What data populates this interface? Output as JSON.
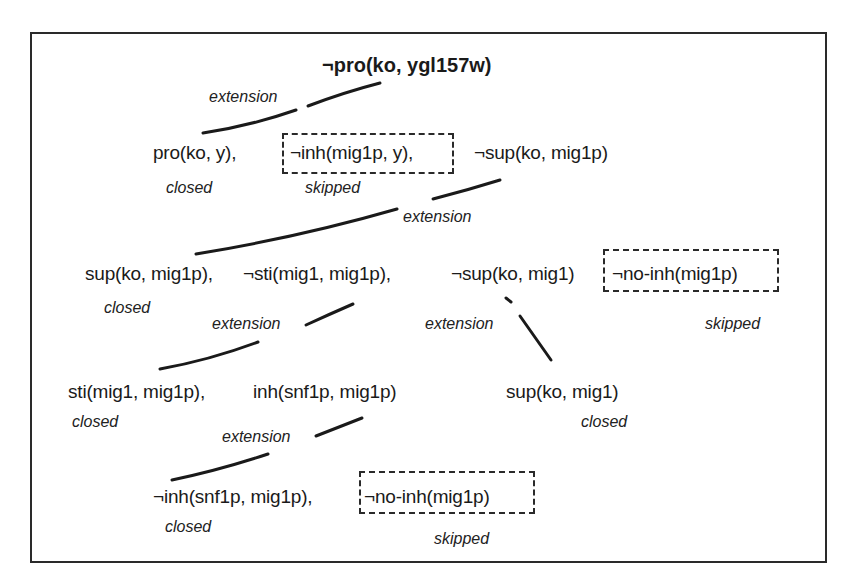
{
  "diagram": {
    "type": "derivation-tree",
    "root": {
      "label": "¬pro(ko, ygl157w)"
    },
    "level1": {
      "edge_label": "extension",
      "literals": [
        {
          "label": "pro(ko, y),",
          "status": "closed"
        },
        {
          "label": "¬inh(mig1p, y),",
          "status": "skipped",
          "boxed": true
        },
        {
          "label": "¬sup(ko, mig1p)",
          "status": ""
        }
      ]
    },
    "level2": {
      "edge_label": "extension",
      "literals": [
        {
          "label": "sup(ko, mig1p),",
          "status": "closed"
        },
        {
          "label": "¬sti(mig1, mig1p),",
          "status": ""
        },
        {
          "label": "¬sup(ko, mig1)",
          "status": ""
        },
        {
          "label": "¬no-inh(mig1p)",
          "status": "skipped",
          "boxed": true
        }
      ]
    },
    "level3_left": {
      "edge_label": "extension",
      "literals": [
        {
          "label": "sti(mig1, mig1p),",
          "status": "closed"
        },
        {
          "label": "inh(snf1p, mig1p)",
          "status": ""
        }
      ]
    },
    "level3_right": {
      "edge_label": "extension",
      "literals": [
        {
          "label": "sup(ko, mig1)",
          "status": "closed"
        }
      ]
    },
    "level4": {
      "edge_label": "extension",
      "literals": [
        {
          "label": "¬inh(snf1p, mig1p),",
          "status": "closed"
        },
        {
          "label": "¬no-inh(mig1p)",
          "status": "skipped",
          "boxed": true
        }
      ]
    }
  },
  "colors": {
    "ink": "#1a1a1a",
    "frame": "#2a2a2a",
    "background": "#ffffff"
  }
}
